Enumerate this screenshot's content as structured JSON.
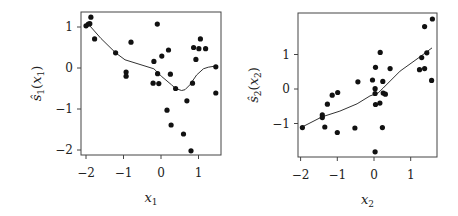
{
  "chart_data": [
    {
      "type": "scatter",
      "title": "",
      "xlabel": "x_1",
      "ylabel": "ŝ_1(x_1)",
      "xlim": [
        -2.15,
        1.6
      ],
      "ylim": [
        -2.12,
        1.37
      ],
      "xticks": [
        -2,
        -1,
        0,
        1
      ],
      "yticks": [
        -2,
        -1,
        0,
        1
      ],
      "grid": false,
      "legend": null,
      "points": {
        "x": [
          -2.0,
          -1.94,
          -1.9,
          -1.87,
          -1.77,
          -1.21,
          -0.8,
          -0.93,
          -0.93,
          -0.1,
          -0.19,
          0.02,
          0.2,
          -0.09,
          0.25,
          -0.21,
          -0.06,
          0.39,
          0.16,
          0.27,
          0.6,
          0.69,
          0.8,
          0.84,
          0.87,
          0.93,
          1.01,
          1.05,
          1.19,
          1.46,
          1.46
        ],
        "y": [
          1.03,
          1.07,
          1.08,
          1.24,
          0.71,
          0.37,
          0.63,
          -0.1,
          -0.2,
          1.07,
          0.16,
          0.29,
          0.44,
          -0.14,
          -0.15,
          -0.37,
          -0.38,
          -0.5,
          -1.03,
          -1.39,
          -1.61,
          -0.8,
          -2.02,
          -0.37,
          0.5,
          0.21,
          0.47,
          0.71,
          0.47,
          0.03,
          -0.61
        ]
      },
      "fitted_curve": {
        "x": [
          -1.94,
          -1.6,
          -1.21,
          -0.96,
          -0.19,
          0.02,
          0.28,
          0.39,
          0.55,
          0.64,
          0.77,
          0.95,
          1.13,
          1.26,
          1.46
        ],
        "y": [
          1.07,
          0.72,
          0.37,
          0.2,
          -0.02,
          -0.21,
          -0.41,
          -0.5,
          -0.55,
          -0.53,
          -0.41,
          -0.17,
          -0.02,
          0.02,
          0.05
        ]
      }
    },
    {
      "type": "scatter",
      "title": "",
      "xlabel": "x_2",
      "ylabel": "ŝ_2(x_2)",
      "xlim": [
        -2.1,
        1.7
      ],
      "ylim": [
        -1.97,
        2.2
      ],
      "xticks": [
        -2,
        -1,
        0,
        1
      ],
      "yticks": [
        -1,
        0,
        1
      ],
      "grid": false,
      "legend": null,
      "points": {
        "x": [
          -1.95,
          -1.41,
          -1.41,
          -1.34,
          -1.27,
          -1.14,
          -0.99,
          -1.0,
          -0.52,
          -0.44,
          -0.04,
          0.04,
          0.17,
          0.44,
          0.03,
          0.03,
          0.24,
          0.25,
          0.31,
          0.04,
          0.16,
          0.23,
          0.03,
          1.59,
          1.38,
          1.3,
          1.44,
          1.24,
          1.38,
          1.57
        ],
        "y": [
          -1.12,
          -0.75,
          -0.83,
          -1.1,
          -0.44,
          -0.18,
          -0.1,
          -1.26,
          -1.13,
          0.21,
          0.26,
          0.63,
          1.06,
          0.59,
          0.01,
          -0.13,
          0.22,
          -0.12,
          -0.15,
          -0.45,
          -0.41,
          -1.12,
          -1.82,
          2.03,
          1.81,
          0.91,
          1.05,
          0.56,
          0.59,
          0.25
        ]
      },
      "fitted_curve": {
        "x": [
          -1.96,
          -1.42,
          -0.93,
          -0.46,
          -0.11,
          0.11,
          0.25,
          0.71,
          1.25,
          1.58
        ],
        "y": [
          -1.1,
          -0.81,
          -0.64,
          -0.43,
          -0.2,
          -0.12,
          0.03,
          0.52,
          0.93,
          1.19
        ]
      }
    }
  ],
  "plots": [
    {
      "frame": {
        "left": 81,
        "top": 12,
        "right": 221,
        "bottom": 155
      },
      "map": {
        "x0": 161,
        "xs": 37.5,
        "y0": 68,
        "ys": 41
      },
      "xtick_labels": [
        "−2",
        "−1",
        "0",
        "1"
      ],
      "ytick_labels": [
        "−2",
        "−1",
        "0",
        "1"
      ],
      "xlabel_main": "x",
      "xlabel_sub": "1",
      "ylabel_main": "ŝ",
      "ylabel_sub": "1",
      "ylabel_arg": "x",
      "ylabel_arg_sub": "1"
    },
    {
      "frame": {
        "left": 298,
        "top": 13,
        "right": 437,
        "bottom": 157
      },
      "map": {
        "x0": 374,
        "xs": 36.7,
        "y0": 89,
        "ys": 34.5
      },
      "xtick_labels": [
        "−2",
        "−1",
        "0",
        "1"
      ],
      "ytick_labels": [
        "−1",
        "0",
        "1"
      ],
      "xlabel_main": "x",
      "xlabel_sub": "2",
      "ylabel_main": "ŝ",
      "ylabel_sub": "2",
      "ylabel_arg": "x",
      "ylabel_arg_sub": "2"
    }
  ],
  "colors": {
    "point": "#111111",
    "line": "#333333",
    "frame": "#444444"
  }
}
